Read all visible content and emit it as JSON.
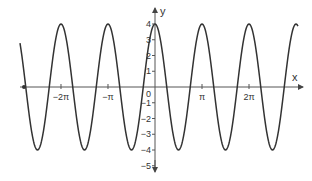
{
  "chart_data": {
    "type": "line",
    "title": "",
    "function": "y = 4cos(2x)",
    "xlabel": "x",
    "ylabel": "y",
    "xlim": [
      -9.0,
      9.6
    ],
    "ylim": [
      -5,
      4.5
    ],
    "x_ticks": [
      {
        "value": -6.2832,
        "label": "−2π"
      },
      {
        "value": -3.1416,
        "label": "−π"
      },
      {
        "value": 3.1416,
        "label": "π"
      },
      {
        "value": 6.2832,
        "label": "2π"
      }
    ],
    "y_ticks": [
      {
        "value": 4,
        "label": "4"
      },
      {
        "value": 3,
        "label": "3"
      },
      {
        "value": 2,
        "label": "2"
      },
      {
        "value": 1,
        "label": "1"
      },
      {
        "value": 0,
        "label": "0"
      },
      {
        "value": -1,
        "label": "−1"
      },
      {
        "value": -2,
        "label": "−2"
      },
      {
        "value": -3,
        "label": "−3"
      },
      {
        "value": -4,
        "label": "−4"
      },
      {
        "value": -5,
        "label": "−5"
      }
    ],
    "series": [
      {
        "name": "4cos(2x)",
        "amplitude": 4,
        "period": 3.1416,
        "color": "#333333",
        "peaks_x": [
          -6.2832,
          -3.1416,
          0,
          3.1416,
          6.2832
        ],
        "troughs_x": [
          -7.854,
          -4.7124,
          -1.5708,
          1.5708,
          4.7124,
          7.854
        ]
      }
    ],
    "grid": false,
    "legend": null,
    "colors": {
      "curve": "#333333",
      "axis": "#555555",
      "text": "#333333"
    }
  },
  "axis_labels": {
    "x": "x",
    "y": "y"
  }
}
